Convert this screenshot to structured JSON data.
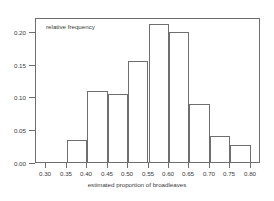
{
  "chart_data": {
    "type": "bar",
    "title": "",
    "subtitle": "",
    "annotation": "relative frequency",
    "xlabel": "estimated proportion of broadleaves",
    "ylabel": "",
    "xlim": [
      0.275,
      0.825
    ],
    "ylim": [
      0.0,
      0.2213
    ],
    "grid": false,
    "legend": null,
    "bin_width": 0.05,
    "bin_edges": [
      0.3,
      0.35,
      0.4,
      0.45,
      0.5,
      0.55,
      0.6,
      0.65,
      0.7,
      0.75,
      0.8
    ],
    "categories": [
      "0.30-0.35",
      "0.35-0.40",
      "0.40-0.45",
      "0.45-0.50",
      "0.50-0.55",
      "0.55-0.60",
      "0.60-0.65",
      "0.65-0.70",
      "0.70-0.75",
      "0.75-0.80"
    ],
    "values": [
      0.0,
      0.034,
      0.108,
      0.104,
      0.154,
      0.21,
      0.198,
      0.089,
      0.04,
      0.026
    ],
    "xticks": [
      "0.30",
      "0.35",
      "0.40",
      "0.45",
      "0.50",
      "0.55",
      "0.60",
      "0.65",
      "0.70",
      "0.75",
      "0.80"
    ],
    "xtick_values": [
      0.3,
      0.35,
      0.4,
      0.45,
      0.5,
      0.55,
      0.6,
      0.65,
      0.7,
      0.75,
      0.8
    ],
    "yticks": [
      "0.00",
      "0.05",
      "0.10",
      "0.15",
      "0.20"
    ],
    "ytick_values": [
      0.0,
      0.05,
      0.1,
      0.15,
      0.2
    ],
    "colors": {
      "bar_stroke": "#6e6e6e",
      "bar_fill": "transparent",
      "axis": "#6e6e6e",
      "text": "#3a3a3a",
      "background": "#ffffff"
    }
  }
}
